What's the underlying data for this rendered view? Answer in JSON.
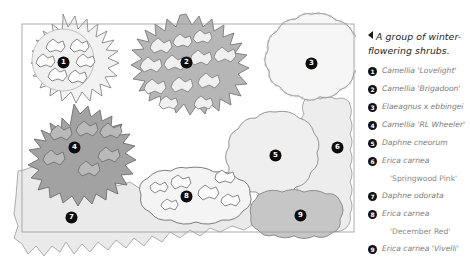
{
  "caption": {
    "marker": "left-triangle",
    "text": "A group of winter-flowering shrubs."
  },
  "legend": {
    "items": [
      {
        "num": "1",
        "genus": "Camellia",
        "cultivar": "'Lovelight'",
        "second_line": ""
      },
      {
        "num": "2",
        "genus": "Camellia",
        "cultivar": "'Brigadoon'",
        "second_line": ""
      },
      {
        "num": "3",
        "genus": "Elaeagnus",
        "hybrid": "x",
        "species": "ebbingei",
        "cultivar": "",
        "second_line": ""
      },
      {
        "num": "4",
        "genus": "Camellia",
        "cultivar": "'RL Wheeler'",
        "second_line": ""
      },
      {
        "num": "5",
        "genus": "Daphne",
        "species": "cneorum",
        "cultivar": "",
        "second_line": ""
      },
      {
        "num": "6",
        "genus": "Erica",
        "species": "carnea",
        "cultivar": "",
        "second_line": "'Springwood Pink'"
      },
      {
        "num": "7",
        "genus": "Daphne",
        "species": "odorata",
        "cultivar": "",
        "second_line": ""
      },
      {
        "num": "8",
        "genus": "Erica",
        "species": "carnea",
        "cultivar": "",
        "second_line": "'December Red'"
      },
      {
        "num": "9",
        "genus": "Erica",
        "species": "carnea",
        "cultivar": "'Vivelli'",
        "second_line": ""
      }
    ]
  },
  "plan": {
    "title": "planting-plan",
    "border_color": "#9a9a9a",
    "shrubs": [
      {
        "num": "1",
        "label": "camellia-lovelight",
        "x": 63,
        "y": 63,
        "fill": "#f2f2f2",
        "edge": "spiky"
      },
      {
        "num": "2",
        "label": "camellia-brigadoon",
        "x": 186,
        "y": 63,
        "fill": "#b6b6b6",
        "edge": "spiky"
      },
      {
        "num": "3",
        "label": "elaeagnus-ebbingei",
        "x": 311,
        "y": 64,
        "fill": "#f6f6f6",
        "edge": "bumpy"
      },
      {
        "num": "4",
        "label": "camellia-rl-wheeler",
        "x": 74,
        "y": 148,
        "fill": "#a2a2a2",
        "edge": "spiky"
      },
      {
        "num": "5",
        "label": "daphne-cneorum",
        "x": 275,
        "y": 156,
        "fill": "#efefef",
        "edge": "bumpy"
      },
      {
        "num": "6",
        "label": "erica-carnea-springwood-pink",
        "x": 337,
        "y": 148,
        "fill": "#ededed",
        "edge": "wavy"
      },
      {
        "num": "7",
        "label": "daphne-odorata",
        "x": 71,
        "y": 218,
        "fill": "#e9e9e9",
        "edge": "spiky"
      },
      {
        "num": "8",
        "label": "erica-carnea-december-red",
        "x": 186,
        "y": 197,
        "fill": "#f4f4f4",
        "edge": "bumpy"
      },
      {
        "num": "9",
        "label": "erica-carnea-vivelli",
        "x": 300,
        "y": 216,
        "fill": "#c6c6c6",
        "edge": "bumpy"
      }
    ]
  }
}
